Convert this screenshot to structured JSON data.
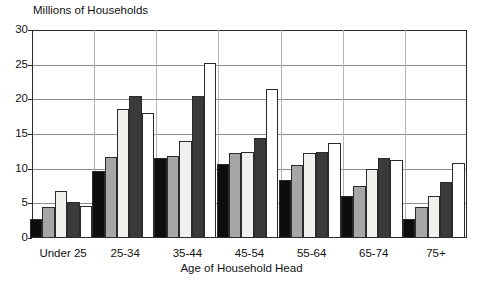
{
  "chart_data": {
    "type": "bar",
    "title": "",
    "ylabel": "Millions of Households",
    "xlabel": "Age of Household Head",
    "ylim": [
      0,
      30
    ],
    "ytick_step": 5,
    "yticks": [
      "0",
      "5",
      "10",
      "15",
      "20",
      "25",
      "30"
    ],
    "grid": true,
    "legend_position": "none",
    "categories": [
      "Under 25",
      "25-34",
      "35-44",
      "45-54",
      "55-64",
      "65-74",
      "75+"
    ],
    "series": [
      {
        "name": "series-1",
        "color": "#0d0d0d",
        "values": [
          2.7,
          9.7,
          11.6,
          10.7,
          8.4,
          6.1,
          2.7
        ]
      },
      {
        "name": "series-2",
        "color": "#a6a6a6",
        "values": [
          4.5,
          11.7,
          11.9,
          12.2,
          10.5,
          7.5,
          4.5
        ]
      },
      {
        "name": "series-3",
        "color": "#f0f0ee",
        "values": [
          6.8,
          18.6,
          14.0,
          12.4,
          12.3,
          9.9,
          6.1
        ]
      },
      {
        "name": "series-4",
        "color": "#3a3a3a",
        "values": [
          5.2,
          20.5,
          20.5,
          14.4,
          12.4,
          11.5,
          8.1
        ]
      },
      {
        "name": "series-5",
        "color": "#ffffff",
        "values": [
          4.6,
          18.0,
          25.3,
          21.5,
          13.7,
          11.2,
          10.8
        ]
      }
    ]
  },
  "axes": {
    "y_axis_title": "Millions of Households",
    "x_axis_title": "Age of Household Head"
  }
}
